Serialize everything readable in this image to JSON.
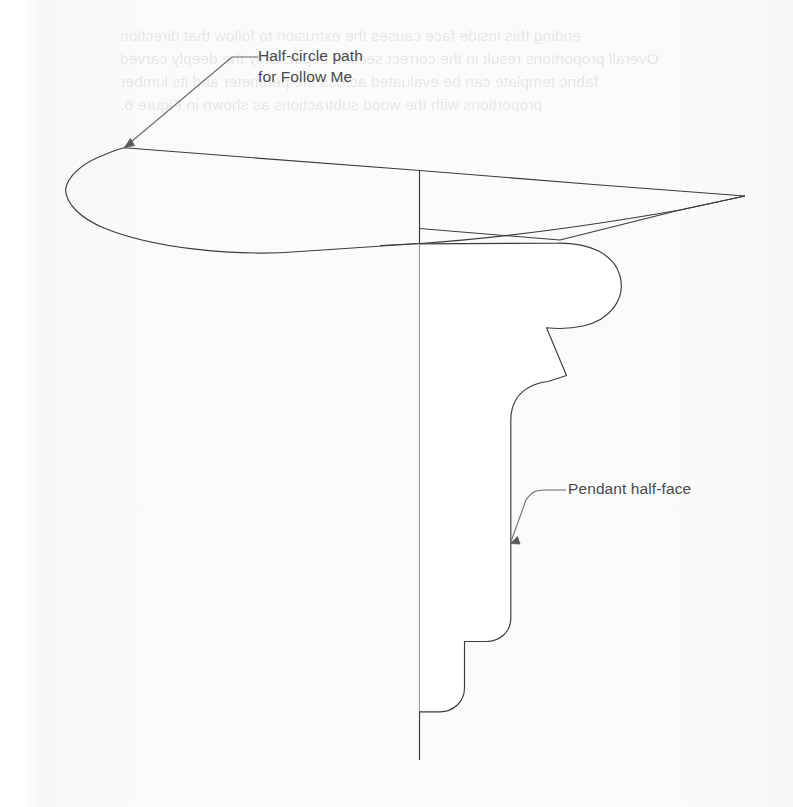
{
  "page": {
    "width": 793,
    "height": 807,
    "background_color": "#fbfbfb",
    "ink_color": "#3a3a3a",
    "label_color": "#4a4a4a"
  },
  "showthrough": {
    "note": "faint mirrored bleed-through text from the reverse side of the scanned page",
    "lines": "ending this inside face causes the extrusion to follow that direction\nOverall proportions result in the correct section depth. Only the deeply carved\nfabric template can be evaluated across the perimeter and its lumber\nproportions with the wood subtractions as shown in Figure 6."
  },
  "annotations": [
    {
      "id": "half-circle-path",
      "text": "Half-circle path\nfor Follow Me",
      "label_x": 258,
      "label_y": 46,
      "leader": {
        "elbow_x": 258,
        "elbow_y": 57,
        "bend_x": 232,
        "bend_y": 57,
        "tip_x": 124,
        "tip_y": 148
      }
    },
    {
      "id": "pendant-half-face",
      "text": "Pendant half-face",
      "label_x": 568,
      "label_y": 479,
      "leader": {
        "elbow_x": 566,
        "elbow_y": 490,
        "bend_x": 544,
        "bend_y": 490,
        "tip_x": 510,
        "tip_y": 543
      }
    }
  ],
  "geometry": {
    "axis_line": {
      "name": "vertical-rotation-axis",
      "x": 419,
      "y_top": 170,
      "y_bottom": 760
    },
    "half_circle_path": {
      "name": "half-circle-follow-me-path",
      "description": "flattened elliptical sweep path seen in perspective, left tip at (65,190), right tip at (745,196)",
      "left_tip": [
        65,
        190
      ],
      "right_tip": [
        745,
        196
      ],
      "start_point": [
        124,
        148
      ]
    },
    "pendant_profile": {
      "name": "pendant-half-face-profile",
      "description": "ogee molding half-section extruded along the half-circle path",
      "top_y": 243,
      "bottom_y": 712,
      "left_x": 419,
      "max_right_x": 622
    }
  }
}
